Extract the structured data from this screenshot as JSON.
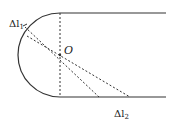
{
  "diagram": {
    "type": "physics-geometry",
    "labels": {
      "center": "O",
      "delta_l1_base": "Δl",
      "delta_l1_sub": "1",
      "delta_l2_base": "Δl",
      "delta_l2_sub": "2"
    },
    "colors": {
      "stroke": "#333333",
      "background": "#ffffff"
    }
  }
}
